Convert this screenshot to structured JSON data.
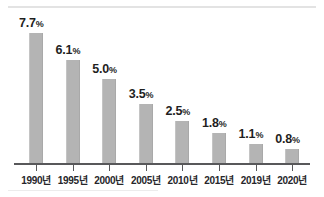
{
  "chart_data": {
    "type": "bar",
    "title": "",
    "subtitle": "",
    "xlabel": "",
    "ylabel": "",
    "categories": [
      "1990년",
      "1995년",
      "2000년",
      "2005년",
      "2010년",
      "2015년",
      "2019년",
      "2020년"
    ],
    "values": [
      7.7,
      6.1,
      5.0,
      3.5,
      2.5,
      1.8,
      1.1,
      0.8
    ],
    "value_labels": [
      "7.7",
      "6.1",
      "5.0",
      "3.5",
      "2.5",
      "1.8",
      "1.1",
      "0.8"
    ],
    "unit_suffix": "%",
    "ylim": [
      0,
      8.2
    ],
    "grid": false,
    "legend": null,
    "legend_position": "none",
    "axis_visible": {
      "x": true,
      "y": false
    },
    "bar_color": "#b4b4b4",
    "axis_color": "#58585a",
    "label_color": "#1f1f1f"
  },
  "figure": {
    "top_rule_color": "#e3e3e3",
    "background": "#ffffff"
  }
}
